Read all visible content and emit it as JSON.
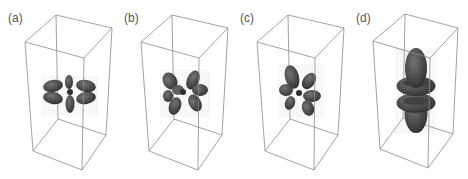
{
  "figure": {
    "panels": [
      {
        "id": "a",
        "label": "(a)",
        "shape": "d-orbital-planar-four-lobe"
      },
      {
        "id": "b",
        "label": "(b)",
        "shape": "d-orbital-tilted-four-lobe"
      },
      {
        "id": "c",
        "label": "(c)",
        "shape": "d-orbital-rotated-four-lobe"
      },
      {
        "id": "d",
        "label": "(d)",
        "shape": "dz2-orbital-with-double-torus"
      }
    ]
  },
  "colors": {
    "box_edge": "#8a8a8a",
    "lobe_fill": "#4a4a4a",
    "lobe_dark": "#2e2e2e",
    "lobe_light": "#6a6a6a",
    "mesh": "#808080",
    "label": "#555555"
  }
}
